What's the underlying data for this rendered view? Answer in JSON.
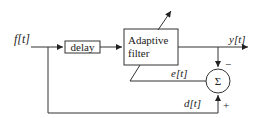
{
  "diagram": {
    "input_signal": "f[t]",
    "delay_block": "delay",
    "filter_block": {
      "line1": "Adaptive",
      "line2": "filter"
    },
    "output_signal": "y[t]",
    "error_signal": "e[t]",
    "desired_signal": "d[t]",
    "summer_symbol": "Σ",
    "summer_minus": "−",
    "summer_plus": "+",
    "colors": {
      "line": "#333333",
      "text": "#222222",
      "background": "#ffffff"
    }
  }
}
